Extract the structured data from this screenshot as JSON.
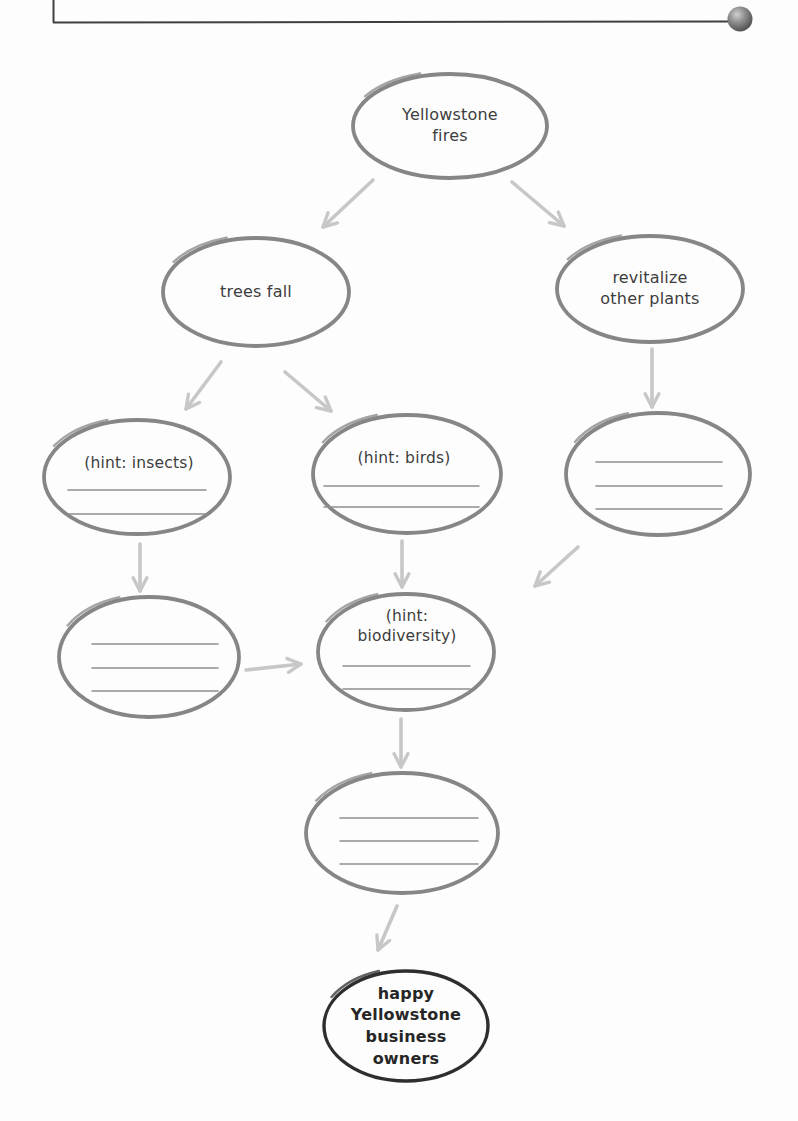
{
  "page": {
    "kind": "concept-map worksheet page",
    "topic": "Yellowstone fires"
  },
  "colors": {
    "node-stroke": "#868686",
    "final-node-stroke": "#2e2e2e",
    "arrow": "#c7c7c7",
    "text": "#3d3d3d",
    "final-text": "#262626",
    "blank-line": "#8f8f8f",
    "frame-line": "#3f3f3f",
    "paper": "#fdfdfd"
  },
  "icons": {
    "corner_ball": "sphere-bullet-icon"
  },
  "diagram": {
    "type": "concept-map",
    "nodes": {
      "yellowstone_fires": {
        "label": "Yellowstone\nfires",
        "blank_lines": 0
      },
      "trees_fall": {
        "label": "trees fall",
        "blank_lines": 0
      },
      "revitalize_other_plants": {
        "label": "revitalize\nother plants",
        "blank_lines": 0
      },
      "hint_insects": {
        "label": "(hint: insects)",
        "blank_lines": 2
      },
      "hint_birds": {
        "label": "(hint: birds)",
        "blank_lines": 2
      },
      "blank_right": {
        "label": "",
        "blank_lines": 3
      },
      "blank_left": {
        "label": "",
        "blank_lines": 3
      },
      "hint_biodiversity": {
        "label": "(hint:\nbiodiversity)",
        "blank_lines": 2
      },
      "blank_middle": {
        "label": "",
        "blank_lines": 3
      },
      "happy_owners": {
        "label": "happy\nYellowstone\nbusiness\nowners",
        "blank_lines": 0
      }
    },
    "edges": [
      {
        "from": "yellowstone_fires",
        "to": "trees_fall"
      },
      {
        "from": "yellowstone_fires",
        "to": "revitalize_other_plants"
      },
      {
        "from": "trees_fall",
        "to": "hint_insects"
      },
      {
        "from": "trees_fall",
        "to": "hint_birds"
      },
      {
        "from": "revitalize_other_plants",
        "to": "blank_right"
      },
      {
        "from": "hint_insects",
        "to": "blank_left"
      },
      {
        "from": "hint_birds",
        "to": "hint_biodiversity"
      },
      {
        "from": "blank_right",
        "to": "hint_biodiversity"
      },
      {
        "from": "blank_left",
        "to": "hint_biodiversity"
      },
      {
        "from": "hint_biodiversity",
        "to": "blank_middle"
      },
      {
        "from": "blank_middle",
        "to": "happy_owners"
      }
    ]
  }
}
